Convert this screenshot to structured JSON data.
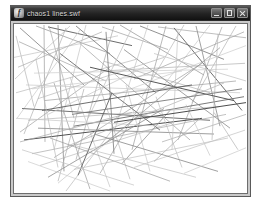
{
  "window": {
    "title": "chaos1 lines.swf",
    "icon_name": "flash-player-icon",
    "icon_glyph": "f",
    "controls": [
      {
        "name": "minimize-button",
        "label": "Minimize"
      },
      {
        "name": "maximize-button",
        "label": "Maximize"
      },
      {
        "name": "close-button",
        "label": "Close"
      }
    ]
  },
  "stage": {
    "background": "#ffffff",
    "border_color": "#6e6e6e",
    "view_box": "0 0 233 172",
    "artwork_name": "random-line-drawing",
    "lines": [
      {
        "x1": 6,
        "y1": 4,
        "x2": 70,
        "y2": 62,
        "color": "#7d7d7d",
        "w": 0.8
      },
      {
        "x1": 22,
        "y1": 2,
        "x2": 96,
        "y2": 30,
        "color": "#8c8c8c",
        "w": 0.7
      },
      {
        "x1": 30,
        "y1": 1,
        "x2": 31,
        "y2": 120,
        "color": "#9a9a9a",
        "w": 0.7
      },
      {
        "x1": 34,
        "y1": 3,
        "x2": 118,
        "y2": 22,
        "color": "#5a5a5a",
        "w": 0.9
      },
      {
        "x1": 35,
        "y1": 2,
        "x2": 60,
        "y2": 96,
        "color": "#a8a8a8",
        "w": 0.7
      },
      {
        "x1": 2,
        "y1": 12,
        "x2": 20,
        "y2": 84,
        "color": "#b4b4b4",
        "w": 0.7
      },
      {
        "x1": 5,
        "y1": 18,
        "x2": 92,
        "y2": 58,
        "color": "#9e9e9e",
        "w": 0.7
      },
      {
        "x1": 0,
        "y1": 34,
        "x2": 104,
        "y2": 12,
        "color": "#c0c0c0",
        "w": 0.7
      },
      {
        "x1": 4,
        "y1": 44,
        "x2": 88,
        "y2": 8,
        "color": "#aaaaaa",
        "w": 0.7
      },
      {
        "x1": 1,
        "y1": 56,
        "x2": 56,
        "y2": 2,
        "color": "#bdbdbd",
        "w": 0.7
      },
      {
        "x1": 2,
        "y1": 70,
        "x2": 122,
        "y2": 36,
        "color": "#b8b8b8",
        "w": 0.7
      },
      {
        "x1": 3,
        "y1": 96,
        "x2": 66,
        "y2": 6,
        "color": "#c6c6c6",
        "w": 0.7
      },
      {
        "x1": 6,
        "y1": 110,
        "x2": 96,
        "y2": 44,
        "color": "#a0a0a0",
        "w": 0.7
      },
      {
        "x1": 44,
        "y1": 1,
        "x2": 50,
        "y2": 150,
        "color": "#8a8a8a",
        "w": 0.8
      },
      {
        "x1": 52,
        "y1": 4,
        "x2": 10,
        "y2": 112,
        "color": "#b0b0b0",
        "w": 0.7
      },
      {
        "x1": 62,
        "y1": 2,
        "x2": 142,
        "y2": 70,
        "color": "#6e6e6e",
        "w": 0.8
      },
      {
        "x1": 72,
        "y1": 1,
        "x2": 40,
        "y2": 128,
        "color": "#c2c2c2",
        "w": 0.7
      },
      {
        "x1": 88,
        "y1": 3,
        "x2": 154,
        "y2": 26,
        "color": "#9c9c9c",
        "w": 0.7
      },
      {
        "x1": 100,
        "y1": 2,
        "x2": 62,
        "y2": 138,
        "color": "#a6a6a6",
        "w": 0.7
      },
      {
        "x1": 106,
        "y1": 1,
        "x2": 190,
        "y2": 52,
        "color": "#8e8e8e",
        "w": 0.7
      },
      {
        "x1": 118,
        "y1": 4,
        "x2": 74,
        "y2": 96,
        "color": "#bcbcbc",
        "w": 0.7
      },
      {
        "x1": 126,
        "y1": 2,
        "x2": 210,
        "y2": 36,
        "color": "#767676",
        "w": 0.8
      },
      {
        "x1": 134,
        "y1": 1,
        "x2": 100,
        "y2": 110,
        "color": "#c4c4c4",
        "w": 0.7
      },
      {
        "x1": 144,
        "y1": 3,
        "x2": 232,
        "y2": 14,
        "color": "#a2a2a2",
        "w": 0.7
      },
      {
        "x1": 152,
        "y1": 2,
        "x2": 118,
        "y2": 128,
        "color": "#9a9a9a",
        "w": 0.7
      },
      {
        "x1": 160,
        "y1": 4,
        "x2": 228,
        "y2": 88,
        "color": "#5e5e5e",
        "w": 0.9
      },
      {
        "x1": 170,
        "y1": 1,
        "x2": 128,
        "y2": 74,
        "color": "#b6b6b6",
        "w": 0.7
      },
      {
        "x1": 182,
        "y1": 2,
        "x2": 206,
        "y2": 104,
        "color": "#888888",
        "w": 0.8
      },
      {
        "x1": 196,
        "y1": 1,
        "x2": 150,
        "y2": 62,
        "color": "#c8c8c8",
        "w": 0.7
      },
      {
        "x1": 208,
        "y1": 3,
        "x2": 164,
        "y2": 118,
        "color": "#a4a4a4",
        "w": 0.7
      },
      {
        "x1": 222,
        "y1": 2,
        "x2": 178,
        "y2": 80,
        "color": "#b2b2b2",
        "w": 0.7
      },
      {
        "x1": 230,
        "y1": 8,
        "x2": 120,
        "y2": 56,
        "color": "#9e9e9e",
        "w": 0.7
      },
      {
        "x1": 232,
        "y1": 22,
        "x2": 96,
        "y2": 74,
        "color": "#cacaca",
        "w": 0.7
      },
      {
        "x1": 231,
        "y1": 40,
        "x2": 86,
        "y2": 48,
        "color": "#b0b0b0",
        "w": 0.7
      },
      {
        "x1": 232,
        "y1": 58,
        "x2": 140,
        "y2": 30,
        "color": "#bebebe",
        "w": 0.7
      },
      {
        "x1": 230,
        "y1": 74,
        "x2": 60,
        "y2": 104,
        "color": "#6a6a6a",
        "w": 0.9
      },
      {
        "x1": 232,
        "y1": 92,
        "x2": 148,
        "y2": 120,
        "color": "#a8a8a8",
        "w": 0.7
      },
      {
        "x1": 231,
        "y1": 108,
        "x2": 120,
        "y2": 146,
        "color": "#c0c0c0",
        "w": 0.7
      },
      {
        "x1": 20,
        "y1": 50,
        "x2": 214,
        "y2": 46,
        "color": "#cccccc",
        "w": 0.7
      },
      {
        "x1": 12,
        "y1": 62,
        "x2": 226,
        "y2": 70,
        "color": "#c6c6c6",
        "w": 0.7
      },
      {
        "x1": 30,
        "y1": 78,
        "x2": 222,
        "y2": 58,
        "color": "#9c9c9c",
        "w": 0.7
      },
      {
        "x1": 8,
        "y1": 86,
        "x2": 196,
        "y2": 98,
        "color": "#707070",
        "w": 1.0
      },
      {
        "x1": 14,
        "y1": 98,
        "x2": 206,
        "y2": 84,
        "color": "#b4b4b4",
        "w": 0.7
      },
      {
        "x1": 24,
        "y1": 106,
        "x2": 200,
        "y2": 112,
        "color": "#848484",
        "w": 0.8
      },
      {
        "x1": 10,
        "y1": 118,
        "x2": 188,
        "y2": 96,
        "color": "#4e4e4e",
        "w": 1.0
      },
      {
        "x1": 18,
        "y1": 132,
        "x2": 212,
        "y2": 92,
        "color": "#a6a6a6",
        "w": 0.7
      },
      {
        "x1": 26,
        "y1": 144,
        "x2": 160,
        "y2": 100,
        "color": "#bababa",
        "w": 0.7
      },
      {
        "x1": 34,
        "y1": 156,
        "x2": 150,
        "y2": 86,
        "color": "#8e8e8e",
        "w": 0.8
      },
      {
        "x1": 44,
        "y1": 162,
        "x2": 124,
        "y2": 94,
        "color": "#c4c4c4",
        "w": 0.7
      },
      {
        "x1": 52,
        "y1": 170,
        "x2": 98,
        "y2": 108,
        "color": "#b8b8b8",
        "w": 0.7
      },
      {
        "x1": 40,
        "y1": 60,
        "x2": 76,
        "y2": 168,
        "color": "#9a9a9a",
        "w": 0.7
      },
      {
        "x1": 56,
        "y1": 54,
        "x2": 96,
        "y2": 166,
        "color": "#c2c2c2",
        "w": 0.7
      },
      {
        "x1": 70,
        "y1": 66,
        "x2": 44,
        "y2": 160,
        "color": "#aeaeae",
        "w": 0.7
      },
      {
        "x1": 84,
        "y1": 58,
        "x2": 116,
        "y2": 158,
        "color": "#b6b6b6",
        "w": 0.7
      },
      {
        "x1": 98,
        "y1": 70,
        "x2": 64,
        "y2": 154,
        "color": "#606060",
        "w": 0.9
      },
      {
        "x1": 112,
        "y1": 62,
        "x2": 136,
        "y2": 150,
        "color": "#c8c8c8",
        "w": 0.7
      },
      {
        "x1": 128,
        "y1": 80,
        "x2": 86,
        "y2": 152,
        "color": "#a2a2a2",
        "w": 0.7
      },
      {
        "x1": 142,
        "y1": 74,
        "x2": 168,
        "y2": 146,
        "color": "#bcbcbc",
        "w": 0.7
      },
      {
        "x1": 156,
        "y1": 88,
        "x2": 108,
        "y2": 142,
        "color": "#909090",
        "w": 0.8
      },
      {
        "x1": 172,
        "y1": 82,
        "x2": 196,
        "y2": 134,
        "color": "#c6c6c6",
        "w": 0.7
      },
      {
        "x1": 186,
        "y1": 96,
        "x2": 140,
        "y2": 140,
        "color": "#aaaaaa",
        "w": 0.7
      },
      {
        "x1": 200,
        "y1": 90,
        "x2": 224,
        "y2": 128,
        "color": "#b2b2b2",
        "w": 0.7
      },
      {
        "x1": 8,
        "y1": 128,
        "x2": 120,
        "y2": 164,
        "color": "#c0c0c0",
        "w": 0.7
      },
      {
        "x1": 14,
        "y1": 140,
        "x2": 96,
        "y2": 170,
        "color": "#cacaca",
        "w": 0.7
      },
      {
        "x1": 36,
        "y1": 116,
        "x2": 156,
        "y2": 160,
        "color": "#989898",
        "w": 0.7
      },
      {
        "x1": 62,
        "y1": 124,
        "x2": 182,
        "y2": 156,
        "color": "#bebebe",
        "w": 0.7
      },
      {
        "x1": 80,
        "y1": 112,
        "x2": 204,
        "y2": 150,
        "color": "#868686",
        "w": 0.8
      },
      {
        "x1": 46,
        "y1": 30,
        "x2": 146,
        "y2": 108,
        "color": "#6c6c6c",
        "w": 0.9
      },
      {
        "x1": 66,
        "y1": 20,
        "x2": 176,
        "y2": 118,
        "color": "#a0a0a0",
        "w": 0.7
      },
      {
        "x1": 90,
        "y1": 38,
        "x2": 196,
        "y2": 70,
        "color": "#b0b0b0",
        "w": 0.7
      },
      {
        "x1": 110,
        "y1": 26,
        "x2": 216,
        "y2": 106,
        "color": "#8a8a8a",
        "w": 0.8
      },
      {
        "x1": 130,
        "y1": 44,
        "x2": 34,
        "y2": 92,
        "color": "#c4c4c4",
        "w": 0.7
      },
      {
        "x1": 150,
        "y1": 34,
        "x2": 24,
        "y2": 76,
        "color": "#b6b6b6",
        "w": 0.7
      },
      {
        "x1": 168,
        "y1": 48,
        "x2": 18,
        "y2": 66,
        "color": "#cccccc",
        "w": 0.7
      },
      {
        "x1": 188,
        "y1": 40,
        "x2": 40,
        "y2": 136,
        "color": "#9e9e9e",
        "w": 0.7
      },
      {
        "x1": 210,
        "y1": 60,
        "x2": 54,
        "y2": 124,
        "color": "#aeaeae",
        "w": 0.7
      },
      {
        "x1": 92,
        "y1": 8,
        "x2": 100,
        "y2": 132,
        "color": "#7a7a7a",
        "w": 0.8
      },
      {
        "x1": 164,
        "y1": 6,
        "x2": 158,
        "y2": 128,
        "color": "#c2c2c2",
        "w": 0.7
      },
      {
        "x1": 204,
        "y1": 10,
        "x2": 198,
        "y2": 118,
        "color": "#b8b8b8",
        "w": 0.7
      },
      {
        "x1": 76,
        "y1": 44,
        "x2": 220,
        "y2": 78,
        "color": "#555555",
        "w": 1.0
      },
      {
        "x1": 58,
        "y1": 92,
        "x2": 228,
        "y2": 66,
        "color": "#787878",
        "w": 0.9
      },
      {
        "x1": 28,
        "y1": 88,
        "x2": 178,
        "y2": 62,
        "color": "#5c5c5c",
        "w": 0.9
      },
      {
        "x1": 100,
        "y1": 100,
        "x2": 232,
        "y2": 80,
        "color": "#4a4a4a",
        "w": 1.0
      },
      {
        "x1": 118,
        "y1": 90,
        "x2": 6,
        "y2": 120,
        "color": "#a6a6a6",
        "w": 0.7
      },
      {
        "x1": 146,
        "y1": 104,
        "x2": 2,
        "y2": 96,
        "color": "#c6c6c6",
        "w": 0.7
      },
      {
        "x1": 22,
        "y1": 36,
        "x2": 44,
        "y2": 146,
        "color": "#bababa",
        "w": 0.7
      },
      {
        "x1": 206,
        "y1": 24,
        "x2": 88,
        "y2": 124,
        "color": "#949494",
        "w": 0.7
      },
      {
        "x1": 232,
        "y1": 126,
        "x2": 170,
        "y2": 152,
        "color": "#c8c8c8",
        "w": 0.7
      },
      {
        "x1": 60,
        "y1": 148,
        "x2": 214,
        "y2": 116,
        "color": "#bebebe",
        "w": 0.7
      }
    ]
  }
}
